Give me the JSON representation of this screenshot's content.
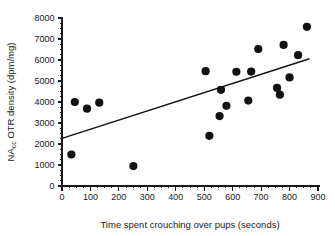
{
  "chart_data": {
    "type": "scatter",
    "title": "",
    "xlabel": "Time spent crouching over pups (seconds)",
    "ylabel": "NAcc OTR density (dpm/mg)",
    "ylabel_main": "NA",
    "ylabel_sub": "cc",
    "ylabel_rest": " OTR density (dpm/mg)",
    "xlim": [
      0,
      900
    ],
    "ylim": [
      0,
      8000
    ],
    "xticks": [
      0,
      100,
      200,
      300,
      400,
      500,
      600,
      700,
      800,
      900
    ],
    "xtick_labels": [
      "0",
      "100",
      "200",
      "300",
      "400",
      "500",
      "600",
      "700",
      "800",
      "900"
    ],
    "yticks": [
      0,
      1000,
      2000,
      3000,
      4000,
      5000,
      6000,
      7000,
      8000
    ],
    "ytick_labels": [
      "0",
      "1000",
      "2000",
      "3000",
      "4000",
      "5000",
      "6000",
      "7000",
      "8000"
    ],
    "x_minor_step": 25,
    "y_minor_step": 250,
    "grid": false,
    "legend": null,
    "marker_color": "#111111",
    "marker_size": 4.1,
    "axis_color": "#1a1a1a",
    "points": [
      {
        "x": 33,
        "y": 1500
      },
      {
        "x": 45,
        "y": 4000
      },
      {
        "x": 88,
        "y": 3680
      },
      {
        "x": 131,
        "y": 3970
      },
      {
        "x": 251,
        "y": 950
      },
      {
        "x": 505,
        "y": 5470
      },
      {
        "x": 518,
        "y": 2390
      },
      {
        "x": 554,
        "y": 3330
      },
      {
        "x": 559,
        "y": 4580
      },
      {
        "x": 578,
        "y": 3820
      },
      {
        "x": 613,
        "y": 5440
      },
      {
        "x": 655,
        "y": 4070
      },
      {
        "x": 665,
        "y": 5450
      },
      {
        "x": 690,
        "y": 6520
      },
      {
        "x": 756,
        "y": 4670
      },
      {
        "x": 766,
        "y": 4350
      },
      {
        "x": 779,
        "y": 6720
      },
      {
        "x": 800,
        "y": 5170
      },
      {
        "x": 830,
        "y": 6230
      },
      {
        "x": 861,
        "y": 7580
      }
    ],
    "trendline": {
      "type": "linear-fit",
      "x_start": 0,
      "y_start": 2270,
      "x_end": 870,
      "y_end": 6060
    }
  }
}
